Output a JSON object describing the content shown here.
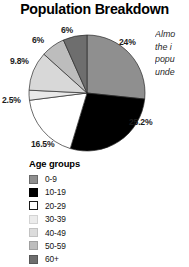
{
  "chart_data": {
    "type": "pie",
    "title": "Population Breakdown",
    "legend_title": "Age groups",
    "legend_position": "bottom-left",
    "grid": false,
    "categories": [
      "0-9",
      "10-19",
      "20-29",
      "30-39",
      "40-49",
      "50-59",
      "60+"
    ],
    "values": [
      24,
      25.2,
      16.5,
      2.5,
      9.8,
      6,
      6
    ],
    "labels": [
      "24%",
      "25.2%",
      "16.5%",
      "2.5%",
      "9.8%",
      "6%",
      "6%"
    ],
    "colors": [
      "#8f8f8f",
      "#000000",
      "#ffffff",
      "#e9e9e9",
      "#d8d8d8",
      "#bdbdbd",
      "#6e6e6e"
    ],
    "xlabel": "",
    "ylabel": "",
    "start_angle_deg": 0,
    "direction": "clockwise"
  },
  "header": {
    "title": "Population Breakdown"
  },
  "pie_labels": [
    {
      "text": "24%",
      "category": "0-9",
      "left": 119,
      "top": 37
    },
    {
      "text": "25.2%",
      "category": "10-19",
      "left": 129,
      "top": 117
    },
    {
      "text": "16.5%",
      "category": "20-29",
      "left": 31,
      "top": 139
    },
    {
      "text": "2.5%",
      "category": "30-39",
      "left": 2,
      "top": 95
    },
    {
      "text": "9.8%",
      "category": "40-49",
      "left": 10,
      "top": 56
    },
    {
      "text": "6%",
      "category": "50-59",
      "left": 32,
      "top": 35
    },
    {
      "text": "6%",
      "category": "60+",
      "left": 61,
      "top": 25
    }
  ],
  "legend": {
    "title": "Age groups",
    "items": [
      {
        "label": "0-9",
        "color": "#8f8f8f",
        "border": "#6a6a6a"
      },
      {
        "label": "10-19",
        "color": "#000000",
        "border": "#000000"
      },
      {
        "label": "20-29",
        "color": "#ffffff",
        "border": "#1a1a1a"
      },
      {
        "label": "30-39",
        "color": "#ececec",
        "border": "#d3d3d3"
      },
      {
        "label": "40-49",
        "color": "#dcdcdc",
        "border": "#c2c2c2"
      },
      {
        "label": "50-59",
        "color": "#bdbdbd",
        "border": "#a0a0a0"
      },
      {
        "label": "60+",
        "color": "#6e6e6e",
        "border": "#575757"
      }
    ]
  },
  "side_text": {
    "lines": [
      "Almo",
      "the i",
      "popu",
      "unde"
    ]
  }
}
